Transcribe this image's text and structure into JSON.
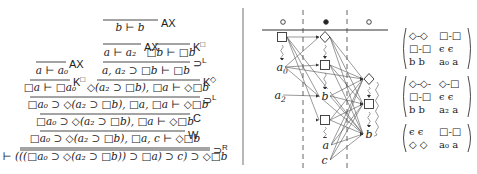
{
  "proof_tree": {
    "lines": [
      {
        "id": "ax_bb",
        "premise_bar": [
          103,
          20,
          158
        ],
        "conclusion": "b ⊢ b",
        "cx": 130,
        "cy": 31,
        "rule": "AX",
        "rule_x": 161,
        "rule_y": 23
      },
      {
        "id": "ax_aa2",
        "premise_bar": [
          103,
          44,
          141
        ],
        "conclusion": "a ⊢ a₂",
        "cx": 120,
        "cy": 56,
        "rule": "AX",
        "rule_x": 144,
        "rule_y": 47
      },
      {
        "id": "k_box_b",
        "premise_bar": [
          155,
          44,
          190
        ],
        "conclusion": "□b ⊢ □b",
        "cx": 171,
        "cy": 56,
        "rule": "K",
        "rule_sup": "□",
        "rule_x": 193,
        "rule_y": 47
      },
      {
        "id": "impl_l_1",
        "premise_bar": [
          103,
          62,
          190
        ],
        "conclusion": "a, a₂ ⊃ □b ⊢ □b",
        "cx": 146,
        "cy": 74,
        "rule": "⊃",
        "rule_sup": "L",
        "rule_x": 193,
        "rule_y": 63
      },
      {
        "id": "ax_aa0",
        "premise_bar": [
          36,
          62,
          66
        ],
        "conclusion": "a ⊢ a₀",
        "cx": 52,
        "cy": 74,
        "rule": "AX",
        "rule_x": 69,
        "rule_y": 64
      },
      {
        "id": "k_box_a0",
        "premise_bar": [
          30,
          80,
          70
        ],
        "conclusion": "□a ⊢ □a₀",
        "cx": 50,
        "cy": 91,
        "rule": "K",
        "rule_sup": "□",
        "rule_x": 73,
        "rule_y": 82
      },
      {
        "id": "k_diam",
        "premise_bar": [
          97,
          80,
          200
        ],
        "conclusion": "◇(a₂ ⊃ □b), □a ⊢ ◇□b",
        "cx": 148,
        "cy": 91,
        "rule": "K",
        "rule_sup": "◇",
        "rule_x": 203,
        "rule_y": 82
      },
      {
        "id": "impl_l_2",
        "premise_bar": [
          30,
          97,
          200
        ],
        "conclusion": "□a₀ ⊃ ◇(a₂ ⊃ □b), □a, □a ⊢ ◇□b",
        "cx": 118,
        "cy": 108,
        "rule": "⊃",
        "rule_sup": "L",
        "rule_x": 203,
        "rule_y": 100
      },
      {
        "id": "contraction",
        "premise_bar": [
          40,
          114,
          190
        ],
        "conclusion": "□a₀ ⊃ ◇(a₂ ⊃ □b), □a ⊢ ◇□b",
        "cx": 115,
        "cy": 125,
        "rule": "C",
        "rule_x": 193,
        "rule_y": 118
      },
      {
        "id": "weakening",
        "premise_bar": [
          40,
          131,
          185
        ],
        "conclusion": "□a₀ ⊃ ◇(a₂ ⊃ □b), □a, c ⊢ ◇□b",
        "cx": 115,
        "cy": 142,
        "rule": "W",
        "rule_x": 188,
        "rule_y": 135
      },
      {
        "id": "impl_r",
        "premise_bar": [
          20,
          148,
          210
        ],
        "conclusion": "⊢ (((□a₀ ⊃ ◇(a₂ ⊃ □b)) ⊃ □a) ⊃ c) ⊃ ◇□b",
        "cx": 115,
        "cy": 160,
        "rule": "⊃",
        "rule_sup": "R",
        "rule_x": 213,
        "rule_y": 150
      }
    ]
  },
  "divider": {
    "x": 243,
    "y1": 8,
    "y2": 165
  },
  "graph": {
    "header": {
      "dots": [
        {
          "x": 283,
          "y": 22,
          "kind": "hollow"
        },
        {
          "x": 326,
          "y": 22,
          "kind": "filled"
        },
        {
          "x": 369,
          "y": 22,
          "kind": "hollow"
        }
      ],
      "rule_line": {
        "x1": 262,
        "x2": 388,
        "y": 30
      }
    },
    "dashed_columns": [
      303,
      347
    ],
    "dashed_y": [
      10,
      168
    ],
    "nodes": [
      {
        "id": "L_box",
        "x": 282,
        "y": 37,
        "kind": "box"
      },
      {
        "id": "L_a0",
        "x": 280,
        "y": 67,
        "kind": "text",
        "label": "a",
        "sub": "0"
      },
      {
        "id": "L_a2",
        "x": 278,
        "y": 95,
        "kind": "text",
        "label": "a",
        "sub": "2"
      },
      {
        "id": "M_diam",
        "x": 325,
        "y": 37,
        "kind": "diamond"
      },
      {
        "id": "M_box1",
        "x": 325,
        "y": 65,
        "kind": "box"
      },
      {
        "id": "M_b",
        "x": 325,
        "y": 96,
        "kind": "text",
        "label": "b"
      },
      {
        "id": "M_box2",
        "x": 325,
        "y": 120,
        "kind": "box"
      },
      {
        "id": "M_a",
        "x": 326,
        "y": 145,
        "kind": "text",
        "label": "a"
      },
      {
        "id": "M_c",
        "x": 325,
        "y": 160,
        "kind": "text",
        "label": "c"
      },
      {
        "id": "R_diam",
        "x": 369,
        "y": 79,
        "kind": "diamond"
      },
      {
        "id": "R_box",
        "x": 369,
        "y": 104,
        "kind": "box"
      },
      {
        "id": "R_b",
        "x": 369,
        "y": 134,
        "kind": "text",
        "label": "b"
      }
    ],
    "edges": [
      [
        "L_box",
        "M_diam"
      ],
      [
        "L_box",
        "M_b"
      ],
      [
        "L_box",
        "M_box2"
      ],
      [
        "L_box",
        "R_b"
      ],
      [
        "L_a0",
        "M_box1"
      ],
      [
        "L_a0",
        "M_diam"
      ],
      [
        "L_a0",
        "R_diam"
      ],
      [
        "L_a0",
        "R_b"
      ],
      [
        "L_a2",
        "M_b"
      ],
      [
        "M_diam",
        "R_diam"
      ],
      [
        "M_diam",
        "R_box"
      ],
      [
        "M_diam",
        "R_b"
      ],
      [
        "M_box1",
        "R_diam"
      ],
      [
        "M_box1",
        "R_box"
      ],
      [
        "M_box1",
        "R_b"
      ],
      [
        "M_b",
        "R_diam"
      ],
      [
        "M_b",
        "R_box"
      ],
      [
        "M_b",
        "R_b"
      ],
      [
        "M_box2",
        "R_box"
      ],
      [
        "M_box2",
        "R_b"
      ],
      [
        "M_box2",
        "R_diam"
      ],
      [
        "M_a",
        "R_b"
      ],
      [
        "M_a",
        "R_box"
      ],
      [
        "M_a",
        "R_diam"
      ],
      [
        "M_c",
        "R_b"
      ],
      [
        "M_c",
        "R_box"
      ],
      [
        "M_c",
        "R_diam"
      ]
    ],
    "squiggles": [
      {
        "x": 282,
        "y1": 45,
        "y2": 60
      },
      {
        "x": 325,
        "y1": 45,
        "y2": 58
      },
      {
        "x": 325,
        "y1": 73,
        "y2": 89
      },
      {
        "x": 325,
        "y1": 127,
        "y2": 139
      },
      {
        "x": 369,
        "y1": 87,
        "y2": 97
      },
      {
        "x": 369,
        "y1": 112,
        "y2": 127
      }
    ],
    "long_wave": {
      "x": 382,
      "y1": 82,
      "y2": 135
    }
  },
  "matrices": [
    {
      "x": 402,
      "y": 28,
      "rows": [
        [
          "◇-◇",
          "□-□"
        ],
        [
          "□-□",
          "ϵ  ϵ"
        ],
        [
          "b  b",
          "a₀ a"
        ]
      ]
    },
    {
      "x": 402,
      "y": 76,
      "rows": [
        [
          "◇-◇-",
          "◇-□"
        ],
        [
          "□-□",
          "ϵ  ϵ"
        ],
        [
          "b  b",
          "a₂ a"
        ]
      ]
    },
    {
      "x": 402,
      "y": 124,
      "rows": [
        [
          "ϵ  ϵ",
          "□-□"
        ],
        [
          "◇ ◇",
          "a₀ a"
        ]
      ]
    }
  ]
}
